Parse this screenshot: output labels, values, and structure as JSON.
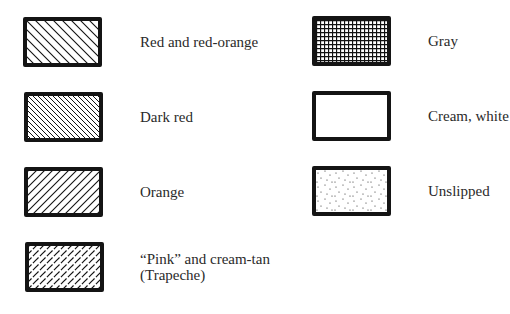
{
  "legend": {
    "left_column": [
      {
        "label": "Red and red-orange",
        "pattern": "diagonal-hatch-sparse"
      },
      {
        "label": "Dark red",
        "pattern": "diagonal-hatch-dense"
      },
      {
        "label": "Orange",
        "pattern": "forward-diagonal-hatch"
      },
      {
        "label_line1": "“Pink” and cream-tan",
        "label_line2": "(Trapeche)",
        "pattern": "dashed-forward-diagonal"
      }
    ],
    "right_column": [
      {
        "label": "Gray",
        "pattern": "grid"
      },
      {
        "label": "Cream, white",
        "pattern": "blank"
      },
      {
        "label": "Unslipped",
        "pattern": "stipple"
      }
    ]
  },
  "colors": {
    "ink": "#141414",
    "background": "#ffffff"
  }
}
